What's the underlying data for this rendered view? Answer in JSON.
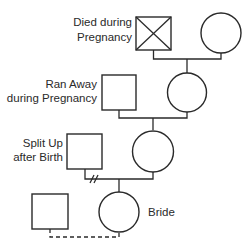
{
  "diagram": {
    "type": "pedigree",
    "generations": [
      {
        "male": {
          "label_lines": [
            "Died during",
            "Pregnancy"
          ],
          "status": "deceased"
        },
        "female": {
          "label_lines": []
        },
        "relationship": "married"
      },
      {
        "male": {
          "label_lines": [
            "Ran Away",
            "during Pregnancy"
          ],
          "status": "left"
        },
        "female": {
          "label_lines": []
        },
        "relationship": "married"
      },
      {
        "male": {
          "label_lines": [
            "Split Up",
            "after Birth"
          ],
          "status": "divorced"
        },
        "female": {
          "label_lines": []
        },
        "relationship": "divorced"
      },
      {
        "male": {
          "label_lines": []
        },
        "female": {
          "label_lines": [
            "Bride"
          ]
        },
        "relationship": "engaged"
      }
    ],
    "symbols": {
      "male": "square",
      "female": "circle",
      "deceased_mark": "x-cross",
      "divorce_mark": "double-slash",
      "engagement_line": "dashed"
    }
  }
}
